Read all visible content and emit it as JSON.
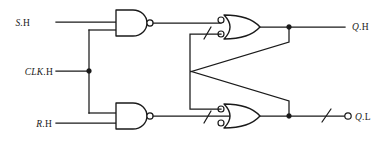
{
  "diagram": {
    "line_color": "#1a1a1a",
    "background_color": "#ffffff"
  },
  "inputs": [
    {
      "id": "s",
      "italic": "S",
      "upright": ".H",
      "label": "S.H",
      "x": 30,
      "y": 23
    },
    {
      "id": "clk",
      "italic": "CLK",
      "upright": ".H",
      "label": "CLK.H",
      "x": 17,
      "y": 74
    },
    {
      "id": "r",
      "italic": "R",
      "upright": ".H",
      "label": "R.H",
      "x": 31,
      "y": 127
    }
  ],
  "outputs": [
    {
      "id": "qh",
      "italic": "Q",
      "upright": ".H",
      "label": "Q.H",
      "x": 352,
      "y": 27
    },
    {
      "id": "ql",
      "italic": "Q",
      "upright": ".L",
      "label": "Q.L",
      "x": 359,
      "y": 121
    }
  ],
  "gates": [
    {
      "id": "nand-top",
      "type": "nand",
      "inverted_output": true,
      "inverted_inputs": false,
      "inputs": 2
    },
    {
      "id": "nand-bottom",
      "type": "nand",
      "inverted_output": true,
      "inverted_inputs": false,
      "inputs": 2
    },
    {
      "id": "or-top",
      "type": "or",
      "inverted_output": false,
      "inverted_inputs": true,
      "inputs": 2
    },
    {
      "id": "or-bottom",
      "type": "or",
      "inverted_output": false,
      "inverted_inputs": true,
      "inputs": 2
    }
  ],
  "markers": {
    "junction_dots": 3,
    "polarity_slashes": 3,
    "output_bubbles": 1
  }
}
